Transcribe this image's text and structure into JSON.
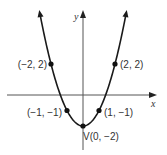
{
  "chart_data": {
    "type": "line",
    "title": "",
    "xlabel": "x",
    "ylabel": "y",
    "function": "y = x^2 - 2",
    "grid": false,
    "legend": null,
    "xlim": [
      -5,
      4.5
    ],
    "ylim": [
      -4,
      5.3
    ],
    "points": [
      {
        "x": -2,
        "y": 2,
        "label": "(−2, 2)"
      },
      {
        "x": -1,
        "y": -1,
        "label": "(−1, −1)"
      },
      {
        "x": 0,
        "y": -2,
        "label": "V(0, −2)"
      },
      {
        "x": 1,
        "y": -1,
        "label": "(1, −1)"
      },
      {
        "x": 2,
        "y": 2,
        "label": "(2, 2)"
      }
    ],
    "annotations": [
      "V(0, −2)"
    ],
    "colors": {
      "curve": "#1a1a1a",
      "axes": "#555555",
      "points": "#111111"
    }
  }
}
